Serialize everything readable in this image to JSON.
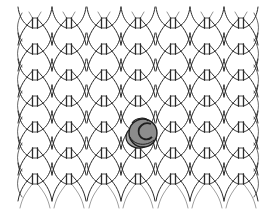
{
  "image": {
    "description": "Knitted stockinette stitch pattern illustration with a yarn ball",
    "width": 276,
    "height": 223,
    "background": "#ffffff"
  },
  "pattern": {
    "columns_x": [
      35,
      69,
      104,
      138,
      173,
      207,
      241
    ],
    "rows_y": [
      23,
      49,
      75,
      101,
      127,
      153,
      179
    ],
    "row_spacing": 26,
    "stroke_color": "#2a2a2a",
    "top_y": 12,
    "bottom_y": 208
  },
  "yarn_ball": {
    "cx": 142,
    "cy": 133,
    "r": 14,
    "fill": "#8c8c8c",
    "back_fill": "#a8a8a8",
    "outline": "#1e1e1e"
  }
}
